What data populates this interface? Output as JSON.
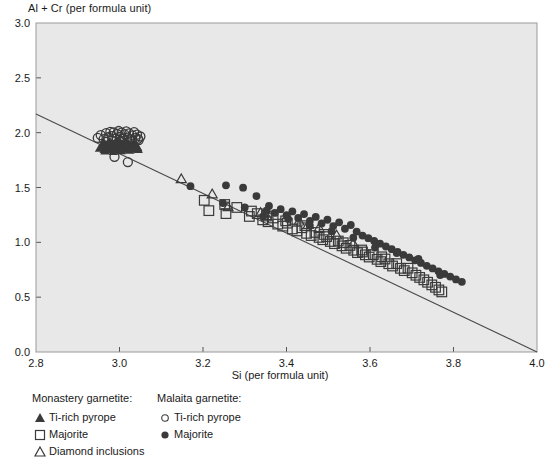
{
  "chart_data": {
    "type": "scatter",
    "title": "",
    "xlabel": "Si (per formula unit)",
    "ylabel": "Al + Cr (per formula unit)",
    "xlim": [
      2.8,
      4.0
    ],
    "ylim": [
      0.0,
      3.0
    ],
    "xticks": [
      "2.8",
      "3.0",
      "3.2",
      "3.4",
      "3.6",
      "3.8",
      "4.0"
    ],
    "xtick_values": [
      2.8,
      3.0,
      3.2,
      3.4,
      3.6,
      3.8,
      4.0
    ],
    "yticks": [
      "0.0",
      "0.5",
      "1.0",
      "1.5",
      "2.0",
      "2.5",
      "3.0"
    ],
    "ytick_values": [
      0.0,
      0.5,
      1.0,
      1.5,
      2.0,
      2.5,
      3.0
    ],
    "grid": false,
    "legend_position": "below-left",
    "plot_background": "#e8e8e8",
    "marker_color": "#3a3a3a",
    "trendline": {
      "label": "linear trend",
      "x": [
        2.8,
        4.0
      ],
      "y": [
        2.17,
        0.0
      ]
    },
    "series": [
      {
        "name": "Monastery garnetite: Ti-rich pyrope",
        "marker": "filled-triangle",
        "color": "#3a3a3a",
        "points": [
          [
            2.952,
            1.858
          ],
          [
            2.958,
            1.872
          ],
          [
            2.963,
            1.845
          ],
          [
            2.967,
            1.886
          ],
          [
            2.97,
            1.861
          ],
          [
            2.973,
            1.899
          ],
          [
            2.976,
            1.84
          ],
          [
            2.979,
            1.874
          ],
          [
            2.982,
            1.905
          ],
          [
            2.984,
            1.852
          ],
          [
            2.986,
            1.888
          ],
          [
            2.988,
            1.866
          ],
          [
            2.99,
            1.91
          ],
          [
            2.992,
            1.843
          ],
          [
            2.994,
            1.879
          ],
          [
            2.996,
            1.897
          ],
          [
            2.998,
            1.858
          ],
          [
            3.0,
            1.884
          ],
          [
            3.002,
            1.914
          ],
          [
            3.004,
            1.849
          ],
          [
            3.006,
            1.871
          ],
          [
            3.008,
            1.893
          ],
          [
            3.01,
            1.862
          ],
          [
            3.012,
            1.906
          ],
          [
            3.014,
            1.876
          ],
          [
            3.016,
            1.848
          ],
          [
            3.018,
            1.889
          ],
          [
            3.02,
            1.867
          ],
          [
            3.022,
            1.902
          ],
          [
            3.024,
            1.855
          ],
          [
            3.026,
            1.881
          ],
          [
            3.028,
            1.87
          ],
          [
            3.03,
            1.896
          ],
          [
            3.032,
            1.859
          ],
          [
            3.034,
            1.878
          ],
          [
            3.036,
            1.865
          ],
          [
            3.038,
            1.887
          ],
          [
            3.04,
            1.852
          ],
          [
            3.042,
            1.873
          ],
          [
            3.044,
            1.862
          ],
          [
            2.961,
            1.912
          ],
          [
            2.965,
            1.833
          ],
          [
            2.975,
            1.922
          ],
          [
            2.985,
            1.827
          ],
          [
            2.995,
            1.925
          ],
          [
            3.005,
            1.834
          ],
          [
            3.015,
            1.918
          ],
          [
            3.025,
            1.838
          ],
          [
            3.035,
            1.908
          ],
          [
            3.045,
            1.845
          ]
        ]
      },
      {
        "name": "Monastery garnetite: Majorite",
        "marker": "open-square",
        "color": "#3a3a3a",
        "points": [
          [
            3.203,
            1.383
          ],
          [
            3.214,
            1.289
          ],
          [
            3.252,
            1.345
          ],
          [
            3.255,
            1.262
          ],
          [
            3.281,
            1.318
          ],
          [
            3.311,
            1.236
          ],
          [
            3.33,
            1.262
          ],
          [
            3.343,
            1.205
          ],
          [
            3.356,
            1.188
          ],
          [
            3.368,
            1.222
          ],
          [
            3.379,
            1.166
          ],
          [
            3.391,
            1.148
          ],
          [
            3.402,
            1.175
          ],
          [
            3.414,
            1.122
          ],
          [
            3.425,
            1.104
          ],
          [
            3.437,
            1.133
          ],
          [
            3.448,
            1.082
          ],
          [
            3.459,
            1.062
          ],
          [
            3.468,
            1.09
          ],
          [
            3.478,
            1.045
          ],
          [
            3.487,
            1.024
          ],
          [
            3.496,
            1.052
          ],
          [
            3.505,
            1.008
          ],
          [
            3.515,
            0.988
          ],
          [
            3.524,
            1.012
          ],
          [
            3.533,
            0.968
          ],
          [
            3.543,
            0.946
          ],
          [
            3.552,
            0.972
          ],
          [
            3.561,
            0.928
          ],
          [
            3.57,
            0.906
          ],
          [
            3.58,
            0.93
          ],
          [
            3.589,
            0.886
          ],
          [
            3.598,
            0.866
          ],
          [
            3.608,
            0.888
          ],
          [
            3.617,
            0.845
          ],
          [
            3.626,
            0.824
          ],
          [
            3.636,
            0.848
          ],
          [
            3.645,
            0.805
          ],
          [
            3.654,
            0.784
          ],
          [
            3.664,
            0.806
          ],
          [
            3.673,
            0.763
          ],
          [
            3.682,
            0.742
          ],
          [
            3.691,
            0.764
          ],
          [
            3.701,
            0.722
          ],
          [
            3.71,
            0.7
          ],
          [
            3.719,
            0.68
          ],
          [
            3.729,
            0.658
          ],
          [
            3.738,
            0.636
          ],
          [
            3.748,
            0.612
          ],
          [
            3.757,
            0.59
          ],
          [
            3.765,
            0.566
          ],
          [
            3.772,
            0.548
          ],
          [
            3.316,
            1.285
          ],
          [
            3.352,
            1.24
          ],
          [
            3.398,
            1.196
          ],
          [
            3.444,
            1.152
          ],
          [
            3.49,
            1.072
          ],
          [
            3.536,
            0.996
          ],
          [
            3.582,
            0.912
          ],
          [
            3.628,
            0.868
          ]
        ]
      },
      {
        "name": "Monastery garnetite: Diamond inclusions",
        "marker": "open-triangle",
        "color": "#3a3a3a",
        "points": [
          [
            3.148,
            1.578
          ],
          [
            3.222,
            1.44
          ],
          [
            3.26,
            1.322
          ],
          [
            3.338,
            1.27
          ],
          [
            3.352,
            1.242
          ],
          [
            3.43,
            1.192
          ],
          [
            3.452,
            1.16
          ],
          [
            3.478,
            1.132
          ],
          [
            3.52,
            1.064
          ],
          [
            3.56,
            0.99
          ]
        ]
      },
      {
        "name": "Malaita garnetite: Ti-rich pyrope",
        "marker": "open-circle",
        "color": "#3a3a3a",
        "points": [
          [
            2.948,
            1.952
          ],
          [
            2.955,
            1.978
          ],
          [
            2.962,
            1.941
          ],
          [
            2.968,
            1.995
          ],
          [
            2.973,
            1.958
          ],
          [
            2.978,
            2.008
          ],
          [
            2.982,
            1.968
          ],
          [
            2.986,
            2.002
          ],
          [
            2.99,
            1.946
          ],
          [
            2.994,
            1.988
          ],
          [
            2.998,
            2.015
          ],
          [
            3.001,
            1.962
          ],
          [
            3.005,
            2.0
          ],
          [
            3.008,
            1.948
          ],
          [
            3.012,
            1.985
          ],
          [
            3.016,
            2.012
          ],
          [
            3.019,
            1.955
          ],
          [
            3.023,
            1.994
          ],
          [
            3.027,
            1.938
          ],
          [
            3.031,
            1.975
          ],
          [
            3.035,
            2.005
          ],
          [
            3.038,
            1.95
          ],
          [
            3.042,
            1.982
          ],
          [
            3.046,
            1.932
          ],
          [
            3.05,
            1.965
          ],
          [
            2.988,
            1.78
          ],
          [
            3.02,
            1.732
          ],
          [
            3.004,
            1.925
          ],
          [
            3.03,
            1.928
          ],
          [
            3.044,
            1.944
          ]
        ]
      },
      {
        "name": "Malaita garnetite: Majorite",
        "marker": "filled-circle",
        "color": "#3a3a3a",
        "points": [
          [
            3.17,
            1.512
          ],
          [
            3.255,
            1.52
          ],
          [
            3.296,
            1.498
          ],
          [
            3.328,
            1.422
          ],
          [
            3.344,
            1.236
          ],
          [
            3.358,
            1.332
          ],
          [
            3.372,
            1.268
          ],
          [
            3.386,
            1.302
          ],
          [
            3.4,
            1.248
          ],
          [
            3.414,
            1.282
          ],
          [
            3.428,
            1.222
          ],
          [
            3.442,
            1.258
          ],
          [
            3.456,
            1.196
          ],
          [
            3.47,
            1.232
          ],
          [
            3.484,
            1.172
          ],
          [
            3.498,
            1.206
          ],
          [
            3.512,
            1.148
          ],
          [
            3.526,
            1.182
          ],
          [
            3.54,
            1.124
          ],
          [
            3.554,
            1.158
          ],
          [
            3.568,
            1.098
          ],
          [
            3.582,
            1.062
          ],
          [
            3.596,
            1.038
          ],
          [
            3.61,
            1.012
          ],
          [
            3.624,
            0.988
          ],
          [
            3.638,
            0.962
          ],
          [
            3.652,
            0.938
          ],
          [
            3.666,
            0.912
          ],
          [
            3.68,
            0.886
          ],
          [
            3.694,
            0.862
          ],
          [
            3.708,
            0.836
          ],
          [
            3.722,
            0.812
          ],
          [
            3.736,
            0.786
          ],
          [
            3.75,
            0.762
          ],
          [
            3.764,
            0.736
          ],
          [
            3.778,
            0.712
          ],
          [
            3.792,
            0.688
          ],
          [
            3.806,
            0.662
          ],
          [
            3.82,
            0.64
          ],
          [
            3.248,
            1.358
          ],
          [
            3.3,
            1.318
          ],
          [
            3.352,
            1.288
          ],
          [
            3.404,
            1.212
          ],
          [
            3.456,
            1.152
          ],
          [
            3.508,
            1.102
          ],
          [
            3.56,
            1.042
          ],
          [
            3.612,
            0.952
          ],
          [
            3.664,
            0.902
          ],
          [
            3.716,
            0.848
          ],
          [
            3.768,
            0.702
          ]
        ]
      }
    ]
  },
  "axes": {
    "ylabel": "Al + Cr (per formula unit)",
    "xlabel": "Si (per formula unit)"
  },
  "legend": {
    "groups": [
      {
        "title": "Monastery garnetite:",
        "entries": [
          {
            "label": "Ti-rich pyrope",
            "marker": "filled-triangle"
          },
          {
            "label": "Majorite",
            "marker": "open-square"
          },
          {
            "label": "Diamond inclusions",
            "marker": "open-triangle"
          }
        ]
      },
      {
        "title": "Malaita garnetite:",
        "entries": [
          {
            "label": "Ti-rich pyrope",
            "marker": "open-circle"
          },
          {
            "label": "Majorite",
            "marker": "filled-circle"
          }
        ]
      }
    ]
  }
}
